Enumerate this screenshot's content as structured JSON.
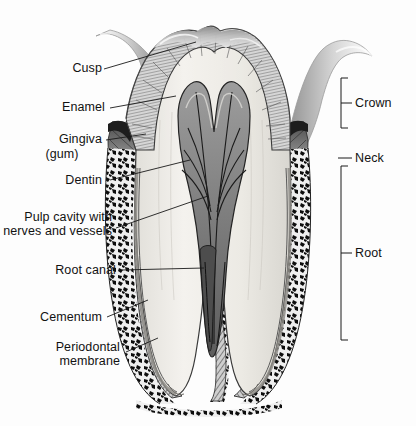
{
  "figure": {
    "width": 416,
    "height": 426,
    "style": "grayscale halftone anatomical illustration",
    "background_color": "#fdfdfd",
    "label_color": "#121212",
    "leader_line_color": "#1a1a1a"
  },
  "labels": {
    "cusp": "Cusp",
    "enamel": "Enamel",
    "gingiva_line1": "Gingiva",
    "gingiva_line2": "(gum)",
    "dentin": "Dentin",
    "pulp_line1": "Pulp cavity with",
    "pulp_line2": "nerves and vessels",
    "root_canal": "Root canal",
    "cementum": "Cementum",
    "periodontal_line1": "Periodontal",
    "periodontal_line2": "membrane",
    "crown": "Crown",
    "neck": "Neck",
    "root": "Root"
  },
  "regions": {
    "enamel": {
      "name": "Enamel",
      "description": "hatched outer layer of the crown",
      "fill": "#cfcfcf"
    },
    "dentin": {
      "name": "Dentin",
      "description": "pale body of the tooth beneath enamel",
      "fill": "#eceae5"
    },
    "pulp": {
      "name": "Pulp cavity with nerves and vessels",
      "description": "central chamber containing nerves and vessels",
      "fill": "#8e8e8e"
    },
    "root_canal": {
      "name": "Root canal",
      "description": "narrow channels running down each root",
      "fill": "#6f6f6f"
    },
    "cementum": {
      "name": "Cementum",
      "description": "thin layer covering the root surface",
      "fill": "#b9b9b9"
    },
    "periodontal_membrane": {
      "name": "Periodontal membrane",
      "description": "fibrous attachment between root and bone",
      "fill": "#9a9a9a"
    },
    "gingiva": {
      "name": "Gingiva (gum)",
      "description": "soft tissue collar around the neck of the tooth",
      "fill": "#7a7a7a"
    },
    "bone": {
      "name": "Alveolar bone",
      "description": "mottled dark spongy bone surrounding the roots",
      "fill": "#111111"
    }
  },
  "brackets": {
    "crown": {
      "label": "Crown",
      "spans": "top of crown to neck"
    },
    "neck": {
      "label": "Neck",
      "spans": "gum line tick"
    },
    "root": {
      "label": "Root",
      "spans": "neck to root apex"
    }
  }
}
